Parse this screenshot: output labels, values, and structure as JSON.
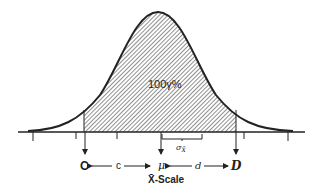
{
  "figure": {
    "center_label": "100γ%",
    "sigma_label": "σ",
    "sigma_sub": "X̄",
    "left_bound": "C",
    "right_bound": "D",
    "mean": "μ",
    "left_distance": "c",
    "right_distance": "d",
    "axis_label": "X̄-Scale"
  },
  "colors": {
    "ink": "#222222",
    "hatch": "#555555",
    "background": "#ffffff"
  }
}
